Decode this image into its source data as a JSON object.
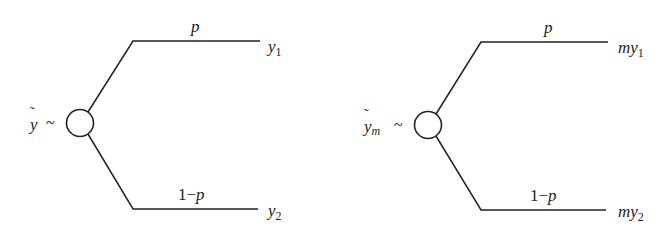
{
  "diagram": {
    "type": "probability-tree",
    "trees": [
      {
        "id": "left",
        "root_label": "y",
        "root_subscript": "",
        "root_tilde": true,
        "root_suffix": "~",
        "branches": [
          {
            "prob": "p",
            "outcome_prefix": "",
            "outcome_var": "y",
            "outcome_sub": "1"
          },
          {
            "prob_num": "1",
            "prob_minus": "−",
            "prob_var": "p",
            "outcome_prefix": "",
            "outcome_var": "y",
            "outcome_sub": "2"
          }
        ]
      },
      {
        "id": "right",
        "root_label": "y",
        "root_subscript": "m",
        "root_tilde": true,
        "root_suffix": "~",
        "branches": [
          {
            "prob": "p",
            "outcome_prefix": "m",
            "outcome_var": "y",
            "outcome_sub": "1"
          },
          {
            "prob_num": "1",
            "prob_minus": "−",
            "prob_var": "p",
            "outcome_prefix": "m",
            "outcome_var": "y",
            "outcome_sub": "2"
          }
        ]
      }
    ],
    "colors": {
      "stroke": "#222222",
      "background": "#ffffff"
    }
  }
}
